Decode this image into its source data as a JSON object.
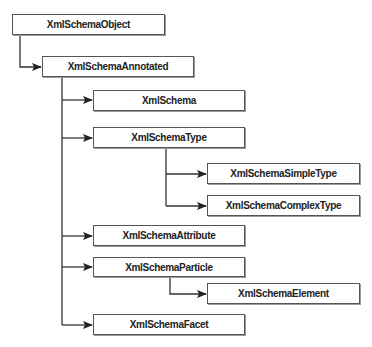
{
  "diagram": {
    "type": "class-hierarchy",
    "nodes": [
      {
        "id": "object",
        "label": "XmlSchemaObject"
      },
      {
        "id": "annotated",
        "label": "XmlSchemaAnnotated"
      },
      {
        "id": "schema",
        "label": "XmlSchema"
      },
      {
        "id": "type",
        "label": "XmlSchemaType"
      },
      {
        "id": "simpletype",
        "label": "XmlSchemaSimpleType"
      },
      {
        "id": "complextype",
        "label": "XmlSchemaComplexType"
      },
      {
        "id": "attribute",
        "label": "XmlSchemaAttribute"
      },
      {
        "id": "particle",
        "label": "XmlSchemaParticle"
      },
      {
        "id": "element",
        "label": "XmlSchemaElement"
      },
      {
        "id": "facet",
        "label": "XmlSchemaFacet"
      }
    ],
    "edges": [
      {
        "from": "object",
        "to": "annotated"
      },
      {
        "from": "annotated",
        "to": "schema"
      },
      {
        "from": "annotated",
        "to": "type"
      },
      {
        "from": "type",
        "to": "simpletype"
      },
      {
        "from": "type",
        "to": "complextype"
      },
      {
        "from": "annotated",
        "to": "attribute"
      },
      {
        "from": "annotated",
        "to": "particle"
      },
      {
        "from": "particle",
        "to": "element"
      },
      {
        "from": "annotated",
        "to": "facet"
      }
    ]
  }
}
